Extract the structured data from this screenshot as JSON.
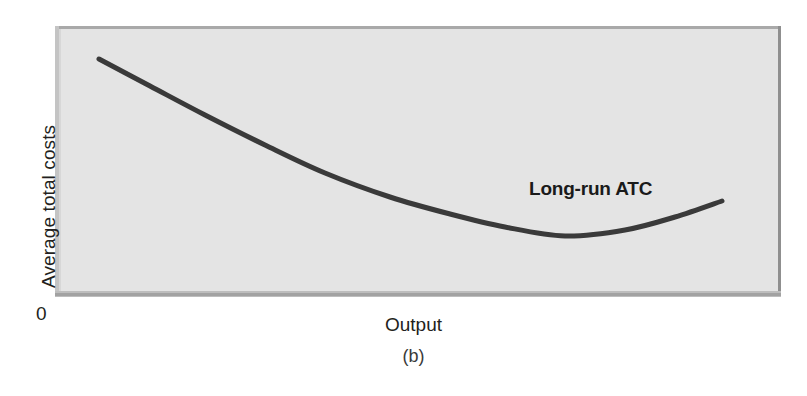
{
  "chart_data": {
    "type": "line",
    "title": "",
    "subtitle": "",
    "caption": "(b)",
    "xlabel": "Output",
    "ylabel": "Average total costs",
    "origin_label": "0",
    "grid": false,
    "legend_position": "none",
    "axis_ticks": {
      "x": [],
      "y": []
    },
    "xlim": [
      0,
      100
    ],
    "ylim": [
      0,
      100
    ],
    "series": [
      {
        "name": "Long-run ATC",
        "annotation": "Long-run ATC",
        "annotation_style": "bold",
        "color": "#3a3a3a",
        "line_width": 5,
        "shape": "u-shaped",
        "x": [
          6,
          13,
          21,
          30,
          39,
          48,
          57,
          66,
          73,
          82,
          90,
          95
        ],
        "y": [
          87,
          79,
          70,
          60,
          49,
          39,
          30,
          23,
          19,
          16,
          19,
          26
        ],
        "points_px": [
          [
            99,
            59
          ],
          [
            150,
            86
          ],
          [
            205,
            115
          ],
          [
            265,
            145
          ],
          [
            325,
            173
          ],
          [
            390,
            197
          ],
          [
            450,
            214
          ],
          [
            505,
            227
          ],
          [
            565,
            236
          ],
          [
            625,
            230
          ],
          [
            675,
            217
          ],
          [
            722,
            201
          ]
        ],
        "minimum_px": [
          565,
          236
        ]
      }
    ]
  },
  "panel": {
    "background_color": "#e4e4e4",
    "border_color": "#a2a2a2",
    "page_background": "#ffffff"
  },
  "labels": {
    "y_axis": "Average total costs",
    "x_axis": "Output",
    "origin": "0",
    "caption": "(b)",
    "curve_annotation": "Long-run ATC"
  }
}
